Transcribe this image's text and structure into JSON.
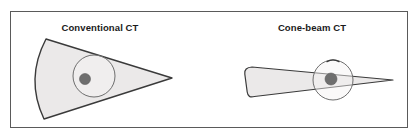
{
  "figure": {
    "width": 418,
    "height": 140,
    "background_color": "#ffffff",
    "border": {
      "color": "#5a5a5a",
      "width": 1,
      "x": 10,
      "y": 11,
      "w": 398,
      "h": 117
    }
  },
  "colors": {
    "beam_fill": "#ebe9e9",
    "beam_stroke": "#3a3a3a",
    "head_fill": "#f4f2f2",
    "head_stroke": "#6e6e6e",
    "lesion_fill": "#6e6e6e",
    "text": "#1a1a1a",
    "frame": "#5a5a5a"
  },
  "panels": [
    {
      "id": "conventional-ct",
      "title": "Conventional CT",
      "title_x": 100,
      "title_y": 31,
      "beam": {
        "type": "fan-beam",
        "apex_x": 172,
        "apex_y": 78,
        "arc_top_x": 46,
        "arc_top_y": 39,
        "arc_bottom_x": 44,
        "arc_bottom_y": 119,
        "arc_bulge_x": 26,
        "arc_bulge_y": 79,
        "path": "M 172 78 L 46 39 Q 26 79 44 119 Z"
      },
      "head": {
        "cx": 94,
        "cy": 76,
        "r": 21,
        "marker": false
      },
      "lesion": {
        "cx": 85,
        "cy": 79,
        "r": 5.5
      }
    },
    {
      "id": "cone-beam-ct",
      "title": "Cone-beam CT",
      "title_x": 312,
      "title_y": 31,
      "beam": {
        "type": "cone-beam",
        "apex_x": 393,
        "apex_y": 80,
        "detector_top_x": 247,
        "detector_top_y": 70,
        "detector_bottom_x": 244,
        "detector_bottom_y": 95,
        "path": "M 393 80 L 251 68 Q 244 69 245 75 L 247 92 Q 248 98 254 96 Z"
      },
      "head": {
        "cx": 333,
        "cy": 80,
        "r": 20,
        "marker": true,
        "marker_label": "head-top-marker"
      },
      "lesion": {
        "cx": 331,
        "cy": 79,
        "r": 6
      }
    }
  ]
}
